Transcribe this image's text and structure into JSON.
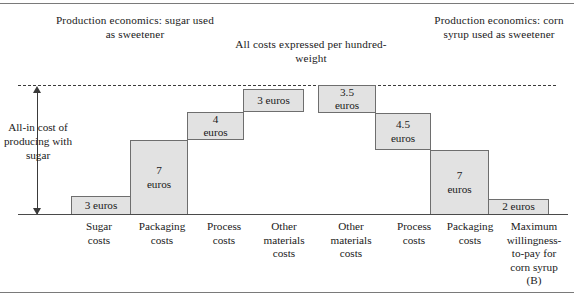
{
  "figure": {
    "notes": {
      "left": "Production\neconomics:\nsugar used as\nsweetener",
      "middle": "All costs expressed\nper hundred-weight",
      "right": "Production\neconomics:\ncorn syrup used\nas sweetener"
    },
    "arrow_label": "All-in\ncost of\nproducing\nwith sugar",
    "dashed_line_note": "all-in cost reference level"
  },
  "chart_data": {
    "type": "bar",
    "subtitle": "All costs expressed per hundred-weight",
    "xlabel": "",
    "ylabel": "Cumulative cost (euros per hundred-weight)",
    "units": "euros",
    "grid": false,
    "legend": false,
    "style": "waterfall-staircase",
    "ylim": [
      0,
      19.5
    ],
    "categories": [
      "Sugar costs",
      "Packaging costs",
      "Process costs",
      "Other materials costs",
      "Other materials costs",
      "Process costs",
      "Packaging costs",
      "Maximum willingness-to-pay for corn syrup (B)"
    ],
    "category_labels": [
      "Sugar\ncosts",
      "Packaging\ncosts",
      "Process\ncosts",
      "Other\nmaterials\ncosts",
      "Other\nmaterials\ncosts",
      "Process\ncosts",
      "Packaging\ncosts",
      "Maximum\nwillingness-\nto-pay for\ncorn syrup\n(B)"
    ],
    "values": [
      3,
      7,
      4,
      3,
      3.5,
      4.5,
      7,
      2
    ],
    "value_labels": [
      "3 euros",
      "7\neuros",
      "4\neuros",
      "3 euros",
      "3.5\neuros",
      "4.5\neuros",
      "7\neuros",
      "2 euros"
    ],
    "cumulative_totals": [
      3,
      10,
      14,
      17,
      17,
      13.5,
      9,
      2
    ],
    "annotations": [
      {
        "text": "All-in cost of producing with sugar",
        "type": "vertical-double-arrow",
        "value": 17
      },
      {
        "text": "Production economics: sugar used as sweetener",
        "side": "left"
      },
      {
        "text": "All costs expressed per hundred-weight",
        "side": "center"
      },
      {
        "text": "Production economics: corn syrup used as sweetener",
        "side": "right"
      }
    ],
    "colors": {
      "bar_fill": "#e2e2e2",
      "bar_stroke": "#6e6e6e",
      "axis": "#4a4a4a",
      "dashed_line": "#3a3a3a",
      "text": "#1a1a1a"
    }
  },
  "steps": [
    {
      "label": "3 euros",
      "x": 71,
      "y": 196,
      "w": 60,
      "h": 19
    },
    {
      "label": "7\neuros",
      "x": 130,
      "y": 140,
      "w": 58,
      "h": 75
    },
    {
      "label": "4\neuros",
      "x": 187,
      "y": 112,
      "w": 57,
      "h": 28
    },
    {
      "label": "3 euros",
      "x": 243,
      "y": 89,
      "w": 61,
      "h": 23
    },
    {
      "label": "3.5\neuros",
      "x": 318,
      "y": 85,
      "w": 58,
      "h": 28
    },
    {
      "label": "4.5\neuros",
      "x": 375,
      "y": 113,
      "w": 56,
      "h": 37
    },
    {
      "label": "7\neuros",
      "x": 430,
      "y": 150,
      "w": 59,
      "h": 65
    },
    {
      "label": "2 euros",
      "x": 488,
      "y": 199,
      "w": 61,
      "h": 16
    }
  ],
  "axis_labels": [
    {
      "label": "Sugar\ncosts",
      "x": 64,
      "w": 70
    },
    {
      "label": "Packaging\ncosts",
      "x": 127,
      "w": 70
    },
    {
      "label": "Process\ncosts",
      "x": 192,
      "w": 64
    },
    {
      "label": "Other\nmaterials\ncosts",
      "x": 249,
      "w": 70
    },
    {
      "label": "Other\nmaterials\ncosts",
      "x": 316,
      "w": 70
    },
    {
      "label": "Process\ncosts",
      "x": 382,
      "w": 64
    },
    {
      "label": "Packaging\ncosts",
      "x": 435,
      "w": 70
    },
    {
      "label": "Maximum\nwillingness-\nto-pay for\ncorn syrup\n(B)",
      "x": 495,
      "w": 78
    }
  ]
}
